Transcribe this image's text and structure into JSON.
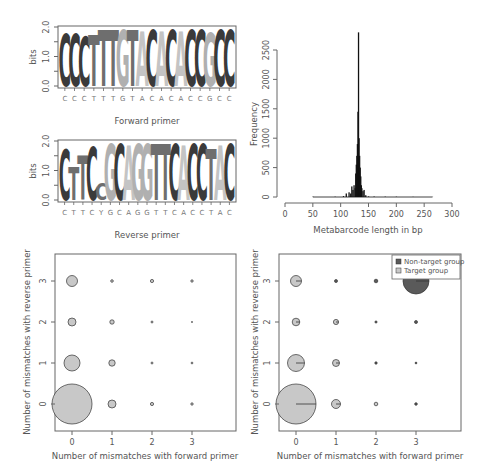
{
  "chart_data": [
    {
      "type": "sequence-logo",
      "panel": "forward-logo",
      "title": "",
      "xlabel": "Forward primer",
      "ylabel": "bits",
      "ylim": [
        0,
        2
      ],
      "yticks": [
        "0.0",
        "1.0",
        "2.0"
      ],
      "sequence": [
        "C",
        "C",
        "C",
        "T",
        "T",
        "T",
        "G",
        "T",
        "A",
        "C",
        "A",
        "C",
        "A",
        "C",
        "C",
        "G",
        "C",
        "C"
      ],
      "heights": [
        1.8,
        1.8,
        1.7,
        1.75,
        1.95,
        1.95,
        1.95,
        1.95,
        1.9,
        1.95,
        1.9,
        1.95,
        1.9,
        1.95,
        1.95,
        1.85,
        1.95,
        1.95
      ]
    },
    {
      "type": "sequence-logo",
      "panel": "reverse-logo",
      "title": "",
      "xlabel": "Reverse primer",
      "ylabel": "bits",
      "ylim": [
        0,
        2
      ],
      "yticks": [
        "0.0",
        "1.0",
        "2.0"
      ],
      "sequence": [
        "C",
        "T",
        "T",
        "C",
        "Y",
        "G",
        "C",
        "A",
        "G",
        "G",
        "T",
        "T",
        "C",
        "A",
        "C",
        "C",
        "T",
        "A",
        "C"
      ],
      "heights": [
        1.75,
        1.15,
        1.55,
        1.85,
        0.6,
        1.95,
        1.95,
        1.9,
        1.95,
        1.95,
        1.95,
        1.95,
        1.95,
        1.9,
        1.95,
        1.95,
        1.75,
        1.9,
        1.95
      ]
    },
    {
      "type": "bar",
      "panel": "length-histogram",
      "title": "",
      "xlabel": "Metabarcode length in bp",
      "ylabel": "Frequency",
      "xlim": [
        0,
        300
      ],
      "ylim": [
        0,
        2800
      ],
      "xticks": [
        "0",
        "50",
        "100",
        "150",
        "200",
        "250",
        "300"
      ],
      "yticks": [
        "0",
        "500",
        "1000",
        "1500",
        "2000",
        "2500"
      ],
      "x": [
        50,
        90,
        105,
        110,
        115,
        118,
        120,
        122,
        124,
        126,
        127,
        128,
        129,
        130,
        131,
        132,
        133,
        134,
        135,
        136,
        137,
        138,
        140,
        142,
        145,
        150,
        160,
        180,
        200,
        230,
        265
      ],
      "values": [
        5,
        5,
        15,
        60,
        80,
        60,
        180,
        120,
        200,
        150,
        400,
        550,
        700,
        900,
        1450,
        2800,
        1000,
        700,
        500,
        350,
        200,
        150,
        100,
        120,
        30,
        10,
        8,
        6,
        5,
        3,
        2
      ]
    },
    {
      "type": "scatter",
      "panel": "bubble-all",
      "title": "",
      "xlabel": "Number of mismatches with forward primer",
      "ylabel": "Number of mismatches with reverse primer",
      "xticks": [
        "0",
        "1",
        "2",
        "3"
      ],
      "yticks": [
        "0",
        "1",
        "2",
        "3"
      ],
      "points": [
        {
          "x": 0,
          "y": 0,
          "r": 20
        },
        {
          "x": 1,
          "y": 0,
          "r": 4
        },
        {
          "x": 2,
          "y": 0,
          "r": 1.6
        },
        {
          "x": 3,
          "y": 0,
          "r": 1.2
        },
        {
          "x": 0,
          "y": 1,
          "r": 8
        },
        {
          "x": 1,
          "y": 1,
          "r": 3.2
        },
        {
          "x": 2,
          "y": 1,
          "r": 1
        },
        {
          "x": 3,
          "y": 1,
          "r": 0.9
        },
        {
          "x": 0,
          "y": 2,
          "r": 4
        },
        {
          "x": 1,
          "y": 2,
          "r": 2.2
        },
        {
          "x": 2,
          "y": 2,
          "r": 1
        },
        {
          "x": 3,
          "y": 2,
          "r": 0.6
        },
        {
          "x": 0,
          "y": 3,
          "r": 5.5
        },
        {
          "x": 1,
          "y": 3,
          "r": 1.3
        },
        {
          "x": 2,
          "y": 3,
          "r": 1.6
        },
        {
          "x": 3,
          "y": 3,
          "r": 1.2
        }
      ]
    },
    {
      "type": "scatter",
      "panel": "bubble-pie",
      "title": "",
      "xlabel": "Number of mismatches with forward primer",
      "ylabel": "Number of mismatches with reverse primer",
      "xticks": [
        "0",
        "1",
        "2",
        "3"
      ],
      "yticks": [
        "0",
        "1",
        "2",
        "3"
      ],
      "legend": [
        "Non-target group",
        "Target group"
      ],
      "legend_position": "top-right",
      "points": [
        {
          "x": 0,
          "y": 0,
          "r": 20,
          "nontarget_frac": 0.0
        },
        {
          "x": 1,
          "y": 0,
          "r": 4.5,
          "nontarget_frac": 0.0
        },
        {
          "x": 2,
          "y": 0,
          "r": 1.8,
          "nontarget_frac": 0.3
        },
        {
          "x": 3,
          "y": 0,
          "r": 1.3,
          "nontarget_frac": 0.9
        },
        {
          "x": 0,
          "y": 1,
          "r": 8.5,
          "nontarget_frac": 0.0
        },
        {
          "x": 1,
          "y": 1,
          "r": 3.5,
          "nontarget_frac": 0.05
        },
        {
          "x": 2,
          "y": 1,
          "r": 1.2,
          "nontarget_frac": 0.9
        },
        {
          "x": 3,
          "y": 1,
          "r": 0.9,
          "nontarget_frac": 0.9
        },
        {
          "x": 0,
          "y": 2,
          "r": 3.8,
          "nontarget_frac": 0.0
        },
        {
          "x": 1,
          "y": 2,
          "r": 2.6,
          "nontarget_frac": 0.1
        },
        {
          "x": 2,
          "y": 2,
          "r": 1.1,
          "nontarget_frac": 0.9
        },
        {
          "x": 3,
          "y": 2,
          "r": 1.5,
          "nontarget_frac": 0.9
        },
        {
          "x": 0,
          "y": 3,
          "r": 5.5,
          "nontarget_frac": 0.02
        },
        {
          "x": 1,
          "y": 3,
          "r": 1.5,
          "nontarget_frac": 0.9
        },
        {
          "x": 2,
          "y": 3,
          "r": 1.8,
          "nontarget_frac": 0.6
        },
        {
          "x": 3,
          "y": 3,
          "r": 13,
          "nontarget_frac": 0.98
        }
      ]
    }
  ],
  "colors": {
    "C": "#3a3a3a",
    "T": "#6e6e6e",
    "G": "#b0b0b0",
    "A": "#c4c4c4",
    "Y": "#6e6e6e",
    "bubble_fill": "#c8c8c8",
    "nontarget_fill": "#5a5a5a",
    "hist": "#111111"
  },
  "legend": {
    "nontarget": "Non-target group",
    "target": "Target group"
  }
}
